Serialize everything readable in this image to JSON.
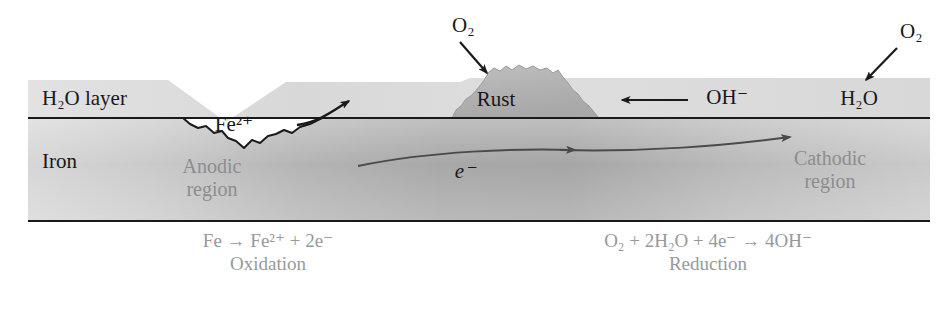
{
  "figure": {
    "layers": {
      "water_label": "H₂O layer",
      "iron_label": "Iron"
    },
    "labels": {
      "o2_left": "O₂",
      "o2_right": "O₂",
      "rust": "Rust",
      "fe2plus": "Fe²⁺",
      "oh_minus": "OH⁻",
      "h2o": "H₂O",
      "electron": "e⁻",
      "anodic_region_line1": "Anodic",
      "anodic_region_line2": "region",
      "cathodic_region_line1": "Cathodic",
      "cathodic_region_line2": "region"
    },
    "equations": {
      "anodic": {
        "reaction": "Fe → Fe²⁺ + 2e⁻",
        "name": "Oxidation"
      },
      "cathodic": {
        "reaction": "O₂ + 2H₂O + 4e⁻ → 4OH⁻",
        "name": "Reduction"
      }
    },
    "colors": {
      "background": "#ffffff",
      "water_layer": "#dcdcdc",
      "iron_layer_light": "#d2d2d2",
      "iron_layer_dark": "#a9a9a9",
      "rust_fill": "#b4b4b4",
      "outline": "#1a1a1a",
      "label_dark": "#18181a",
      "label_muted": "#8d8d90",
      "equation_text": "#98989b"
    }
  }
}
